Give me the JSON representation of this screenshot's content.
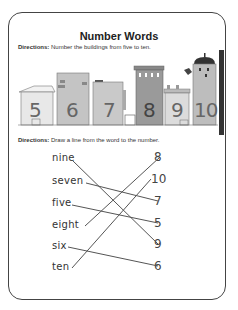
{
  "worksheet": {
    "title": "Number Words",
    "section1": {
      "directions_label": "Directions:",
      "directions_text": "Number the buildings from five to ten.",
      "buildings": [
        {
          "number": "5",
          "color": "#e8e8e8"
        },
        {
          "number": "6",
          "color": "#c4c4c4"
        },
        {
          "number": "7",
          "color": "#c9c9c9"
        },
        {
          "number": "8",
          "color": "#9a9a9a"
        },
        {
          "number": "9",
          "color": "#dcdcdc"
        },
        {
          "number": "10",
          "color": "#bdbdbd"
        }
      ]
    },
    "section2": {
      "directions_label": "Directions:",
      "directions_text": "Draw a line from the word to the number.",
      "words": [
        "nine",
        "seven",
        "five",
        "eight",
        "six",
        "ten"
      ],
      "numbers": [
        "8",
        "10",
        "7",
        "5",
        "9",
        "6"
      ],
      "matches": [
        {
          "word": "nine",
          "number": "9"
        },
        {
          "word": "seven",
          "number": "7"
        },
        {
          "word": "five",
          "number": "5"
        },
        {
          "word": "eight",
          "number": "8"
        },
        {
          "word": "six",
          "number": "6"
        },
        {
          "word": "ten",
          "number": "10"
        }
      ]
    }
  }
}
